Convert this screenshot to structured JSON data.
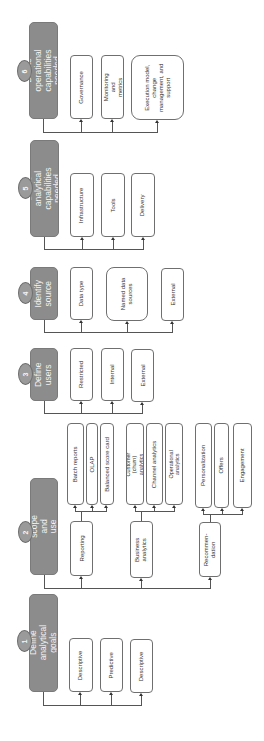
{
  "diagram": {
    "orientation": "rotated-90-ccw",
    "colors": {
      "header_fill": "#8c8c8c",
      "badge_fill": "#9a9a9a",
      "box_border": "#6f6f6f",
      "connector": "#555555"
    },
    "steps": [
      {
        "number": "6",
        "title": "Define operational capabilities needed",
        "children": [
          "Governance",
          "Monitoring and metrics",
          "Execution model, change management, and support"
        ]
      },
      {
        "number": "5",
        "title": "Define analytical capabilities needed",
        "children": [
          "Infrastructure",
          "Tools",
          "Delivery"
        ]
      },
      {
        "number": "4",
        "title": "Identify source",
        "children": [
          "Data type",
          "Named data sources",
          "External"
        ]
      },
      {
        "number": "3",
        "title": "Define users",
        "children": [
          "Restricted",
          "Internal",
          "External"
        ]
      },
      {
        "number": "2",
        "title": "Define scope and use cases",
        "groups": [
          {
            "label": "Reporting",
            "children": [
              "Batch reports",
              "OLAP",
              "Balanced score card"
            ]
          },
          {
            "label": "Business analytics",
            "children": [
              "Customer (churn) analytics",
              "Channel analytics",
              "Operational analytics"
            ]
          },
          {
            "label": "Recommen-dation",
            "children": [
              "Personalization",
              "Offers",
              "Engagement"
            ]
          }
        ]
      },
      {
        "number": "1",
        "title": "Define analytical goals",
        "children": [
          "Descriptive",
          "Predictive",
          "Descriptive"
        ]
      }
    ]
  }
}
